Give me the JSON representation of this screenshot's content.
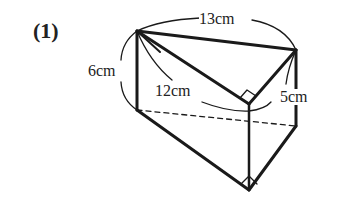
{
  "problem": {
    "number_label": "(1)"
  },
  "figure": {
    "type": "triangular-prism",
    "labels": {
      "top_edge": "13cm",
      "left_height": "6cm",
      "slant_inner": "12cm",
      "right_height": "5cm"
    },
    "colors": {
      "line": "#1a1a1a",
      "background": "#ffffff"
    }
  }
}
